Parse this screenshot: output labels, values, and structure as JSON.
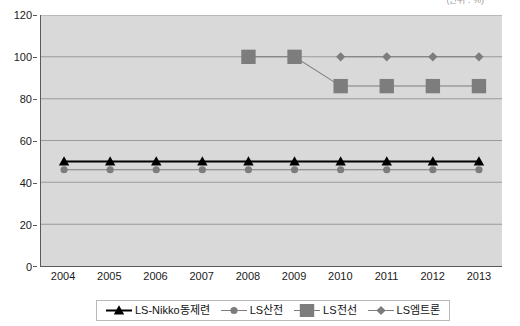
{
  "unit_note": "(단위 : %)",
  "chart_data": {
    "type": "line",
    "title": "",
    "subtitle": "",
    "xlabel": "",
    "ylabel": "",
    "unit_note": "(단위 : %)",
    "categories": [
      "2004",
      "2005",
      "2006",
      "2007",
      "2008",
      "2009",
      "2010",
      "2011",
      "2012",
      "2013"
    ],
    "ylim": [
      0,
      120
    ],
    "ytick_step": 20,
    "yticks": [
      "0",
      "20",
      "40",
      "60",
      "80",
      "100",
      "120"
    ],
    "grid": true,
    "grid_axis": "y",
    "legend_position": "bottom",
    "plot_background": "#d9d9d9",
    "series": [
      {
        "name": "LS-Nikko동제련",
        "marker": "triangle",
        "color": "#000000",
        "line_width": 2,
        "x": [
          "2004",
          "2005",
          "2006",
          "2007",
          "2008",
          "2009",
          "2010",
          "2011",
          "2012",
          "2013"
        ],
        "values": [
          50,
          50,
          50,
          50,
          50,
          50,
          50,
          50,
          50,
          50
        ]
      },
      {
        "name": "LS산전",
        "marker": "circle",
        "color": "#7d7d7d",
        "line_width": 1,
        "x": [
          "2004",
          "2005",
          "2006",
          "2007",
          "2008",
          "2009",
          "2010",
          "2011",
          "2012",
          "2013"
        ],
        "values": [
          46,
          46,
          46,
          46,
          46,
          46,
          46,
          46,
          46,
          46
        ]
      },
      {
        "name": "LS전선",
        "marker": "square",
        "color": "#7d7d7d",
        "line_width": 1,
        "x": [
          "2008",
          "2009",
          "2010",
          "2011",
          "2012",
          "2013"
        ],
        "values": [
          100,
          100,
          86,
          86,
          86,
          86
        ]
      },
      {
        "name": "LS엠트론",
        "marker": "diamond",
        "color": "#7d7d7d",
        "line_width": 1,
        "x": [
          "2010",
          "2011",
          "2012",
          "2013"
        ],
        "values": [
          100,
          100,
          100,
          100
        ]
      }
    ]
  },
  "legend": {
    "items": [
      {
        "label": "LS-Nikko동제련",
        "marker": "triangle",
        "color": "#000000"
      },
      {
        "label": "LS산전",
        "marker": "circle",
        "color": "#7d7d7d"
      },
      {
        "label": "LS전선",
        "marker": "square",
        "color": "#7d7d7d"
      },
      {
        "label": "LS엠트론",
        "marker": "diamond",
        "color": "#7d7d7d"
      }
    ]
  }
}
